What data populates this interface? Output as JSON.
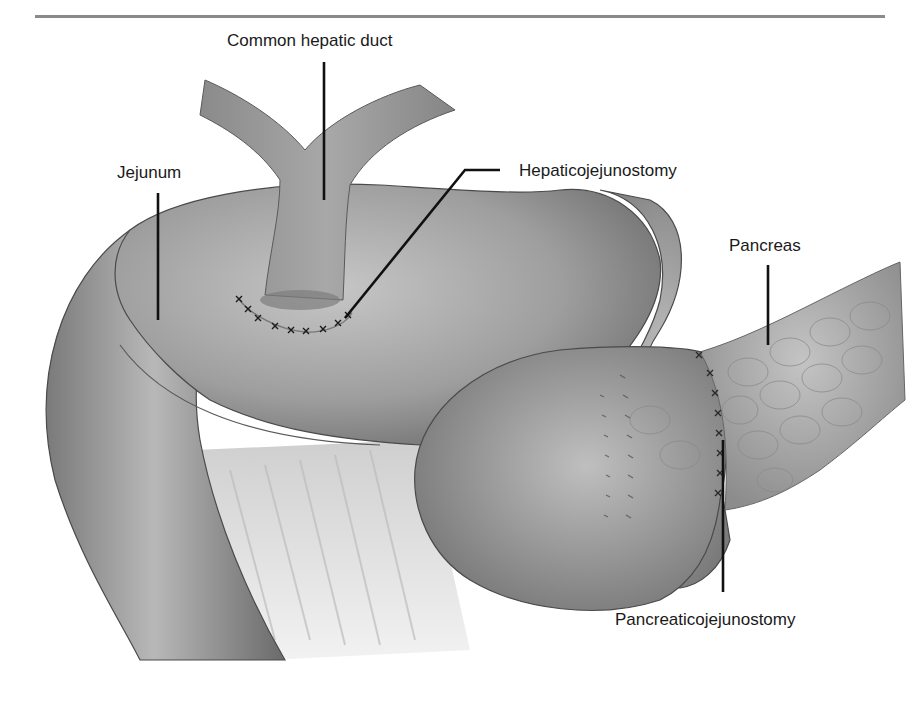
{
  "figure": {
    "type": "anatomical illustration",
    "labels": {
      "common_hepatic_duct": "Common hepatic duct",
      "jejunum": "Jejunum",
      "hepaticojejunostomy": "Hepaticojejunostomy",
      "pancreas": "Pancreas",
      "pancreaticojejunostomy": "Pancreaticojejunostomy"
    },
    "colors": {
      "organ_fill": "#9a9a9a",
      "organ_light": "#c4c4c4",
      "organ_dark": "#6e6e6e",
      "outline": "#4a4a4a",
      "leader_line": "#111111",
      "mesentery": "#d6d6d6",
      "header_rule": "#8a8a8a"
    }
  }
}
